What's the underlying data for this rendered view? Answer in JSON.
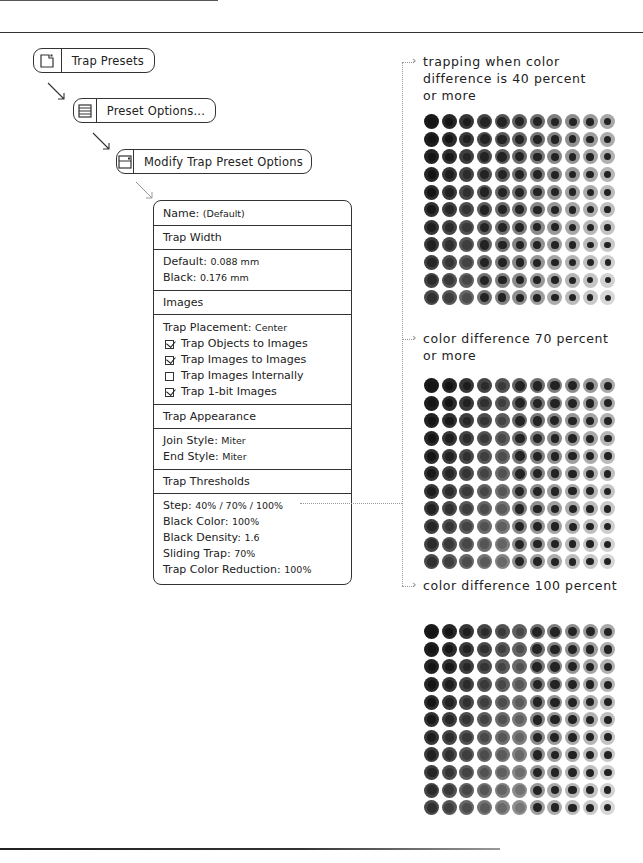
{
  "menu_path": [
    {
      "label": "Trap Presets",
      "icon": "new-document-icon"
    },
    {
      "label": "Preset Options...",
      "icon": "list-icon"
    },
    {
      "label": "Modify Trap Preset Options",
      "icon": "window-icon"
    }
  ],
  "panel": {
    "name_label": "Name:",
    "name_value": "(Default)",
    "trap_width_header": "Trap Width",
    "default_label": "Default:",
    "default_value": "0.088 mm",
    "black_label": "Black:",
    "black_value": "0.176 mm",
    "images_header": "Images",
    "trap_placement_label": "Trap Placement:",
    "trap_placement_value": "Center",
    "checkboxes": [
      {
        "label": "Trap Objects to Images",
        "checked": true
      },
      {
        "label": "Trap Images to Images",
        "checked": true
      },
      {
        "label": "Trap Images Internally",
        "checked": false
      },
      {
        "label": "Trap 1-bit Images",
        "checked": true
      }
    ],
    "trap_appearance_header": "Trap Appearance",
    "join_style_label": "Join Style:",
    "join_style_value": "Miter",
    "end_style_label": "End Style:",
    "end_style_value": "Miter",
    "trap_thresholds_header": "Trap Thresholds",
    "step_label": "Step:",
    "step_value": "40% / 70% / 100%",
    "black_color_label": "Black Color:",
    "black_color_value": "100%",
    "black_density_label": "Black Density:",
    "black_density_value": "1.6",
    "sliding_trap_label": "Sliding Trap:",
    "sliding_trap_value": "70%",
    "trap_color_reduction_label": "Trap Color Reduction:",
    "trap_color_reduction_value": "100%"
  },
  "examples": [
    {
      "caption_lines": [
        "trapping when color",
        "difference is 40 percent",
        "or more"
      ],
      "threshold": 40
    },
    {
      "caption_lines": [
        "color difference 70 percent",
        "or more"
      ],
      "threshold": 70
    },
    {
      "caption_lines": [
        "color difference 100 percent"
      ],
      "threshold": 100
    }
  ],
  "grid": {
    "rows": 11,
    "cols": 11
  },
  "colors": {
    "ink": "#222222",
    "line": "#333333",
    "dotted": "#999999"
  }
}
